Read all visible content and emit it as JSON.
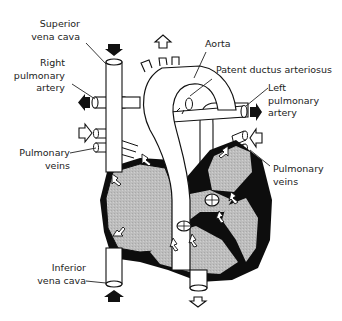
{
  "diagram": {
    "colors": {
      "outline": "#111111",
      "chamber_fill": "#bdbdbd",
      "wall": "#0d0d0d",
      "vessel_fill": "#ffffff",
      "label_text": "#222222"
    },
    "labels": {
      "superior_vena_cava": {
        "line1": "Superior",
        "line2": "vena cava"
      },
      "right_pulmonary_artery": {
        "line1": "Right",
        "line2": "pulmonary",
        "line3": "artery"
      },
      "pulmonary_veins_left": {
        "line1": "Pulmonary",
        "line2": "veins"
      },
      "inferior_vena_cava": {
        "line1": "Inferior",
        "line2": "vena cava"
      },
      "aorta": {
        "line1": "Aorta"
      },
      "patent_ductus_arteriosus": {
        "line1": "Patent ductus arteriosus"
      },
      "left_pulmonary_artery": {
        "line1": "Left",
        "line2": "pulmonary",
        "line3": "artery"
      },
      "pulmonary_veins_right": {
        "line1": "Pulmonary",
        "line2": "veins"
      }
    },
    "flow_arrows": [
      {
        "location": "superior vena cava top",
        "direction": "down",
        "style": "filled"
      },
      {
        "location": "aorta top",
        "direction": "up",
        "style": "outline"
      },
      {
        "location": "right pulmonary artery",
        "direction": "left",
        "style": "filled"
      },
      {
        "location": "right pulmonary veins",
        "direction": "right",
        "style": "outline"
      },
      {
        "location": "left pulmonary artery",
        "direction": "right",
        "style": "filled"
      },
      {
        "location": "left pulmonary veins",
        "direction": "left",
        "style": "outline"
      },
      {
        "location": "inferior vena cava bottom",
        "direction": "up",
        "style": "filled"
      },
      {
        "location": "descending aorta bottom",
        "direction": "down",
        "style": "outline"
      }
    ]
  }
}
